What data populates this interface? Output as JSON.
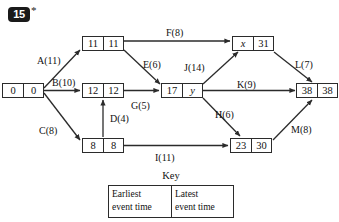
{
  "question": {
    "number": "15",
    "star": "*"
  },
  "diagram": {
    "type": "activity-network",
    "nodes": [
      {
        "id": "start",
        "earliest": "0",
        "latest": "0",
        "x": 2,
        "y": 83,
        "latest_italic": false,
        "earliest_italic": false
      },
      {
        "id": "n11",
        "earliest": "11",
        "latest": "11",
        "x": 82,
        "y": 36,
        "latest_italic": false,
        "earliest_italic": false
      },
      {
        "id": "n12",
        "earliest": "12",
        "latest": "12",
        "x": 82,
        "y": 83,
        "latest_italic": false,
        "earliest_italic": false
      },
      {
        "id": "n8",
        "earliest": "8",
        "latest": "8",
        "x": 82,
        "y": 138,
        "latest_italic": false,
        "earliest_italic": false
      },
      {
        "id": "n17y",
        "earliest": "17",
        "latest": "y",
        "x": 161,
        "y": 83,
        "latest_italic": true,
        "earliest_italic": false
      },
      {
        "id": "nx31",
        "earliest": "x",
        "latest": "31",
        "x": 232,
        "y": 36,
        "latest_italic": false,
        "earliest_italic": true
      },
      {
        "id": "n2330",
        "earliest": "23",
        "latest": "30",
        "x": 230,
        "y": 138,
        "latest_italic": false,
        "earliest_italic": false
      },
      {
        "id": "n38",
        "earliest": "38",
        "latest": "38",
        "x": 296,
        "y": 83,
        "latest_italic": false,
        "earliest_italic": false
      }
    ],
    "activities": [
      {
        "id": "A",
        "label": "A(11)",
        "x": 37,
        "y": 55,
        "from": "start",
        "to": "n11"
      },
      {
        "id": "B",
        "label": "B(10)",
        "x": 52,
        "y": 77,
        "from": "start",
        "to": "n12"
      },
      {
        "id": "C",
        "label": "C(8)",
        "x": 39,
        "y": 125,
        "from": "start",
        "to": "n8"
      },
      {
        "id": "D",
        "label": "D(4)",
        "x": 110,
        "y": 113,
        "from": "n8",
        "to": "n12"
      },
      {
        "id": "E",
        "label": "E(6)",
        "x": 143,
        "y": 59,
        "from": "n11",
        "to": "n17y"
      },
      {
        "id": "F",
        "label": "F(8)",
        "x": 166,
        "y": 27,
        "from": "n11",
        "to": "nx31"
      },
      {
        "id": "G",
        "label": "G(5)",
        "x": 131,
        "y": 100,
        "from": "n12",
        "to": "n17y"
      },
      {
        "id": "H",
        "label": "H(6)",
        "x": 215,
        "y": 109,
        "from": "n17y",
        "to": "n2330"
      },
      {
        "id": "I",
        "label": "I(11)",
        "x": 155,
        "y": 152,
        "from": "n8",
        "to": "n2330"
      },
      {
        "id": "J",
        "label": "J(14)",
        "x": 184,
        "y": 62,
        "from": "n17y",
        "to": "nx31"
      },
      {
        "id": "K",
        "label": "K(9)",
        "x": 237,
        "y": 79,
        "from": "n17y",
        "to": "n38"
      },
      {
        "id": "L",
        "label": "L(7)",
        "x": 295,
        "y": 59,
        "from": "nx31",
        "to": "n38"
      },
      {
        "id": "M",
        "label": "M(8)",
        "x": 291,
        "y": 124,
        "from": "n2330",
        "to": "n38"
      }
    ]
  },
  "key": {
    "title": "Key",
    "left_line1": "Earliest",
    "left_line2": "event time",
    "right_line1": "Latest",
    "right_line2": "event time"
  },
  "colors": {
    "ink": "#111111",
    "line": "#2b2b2b",
    "badge_bg": "#1a1a1a",
    "paper": "#ffffff"
  }
}
